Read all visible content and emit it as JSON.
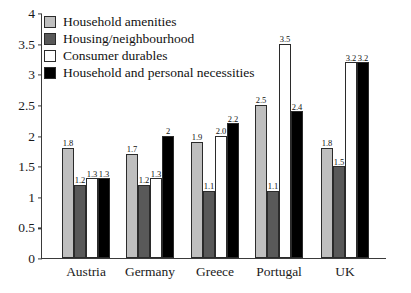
{
  "chart_data": {
    "type": "bar",
    "title": "",
    "xlabel": "",
    "ylabel": "",
    "grid": false,
    "legend_position": "top-left",
    "ylim": [
      0,
      4
    ],
    "ytick_labels": [
      "0",
      "0.5",
      "1",
      "1.5",
      "2",
      "2.5",
      "3",
      "3.5",
      "4"
    ],
    "ytick_values": [
      0,
      0.5,
      1,
      1.5,
      2,
      2.5,
      3,
      3.5,
      4
    ],
    "categories": [
      "Austria",
      "Germany",
      "Greece",
      "Portugal",
      "UK"
    ],
    "series": [
      {
        "name": "Household amenities",
        "color": "#bfbfbf",
        "values": [
          1.8,
          1.7,
          1.9,
          2.5,
          1.8
        ],
        "labels": [
          "1.8",
          "1.7",
          "1.9",
          "2.5",
          "1.8"
        ]
      },
      {
        "name": "Housing/neighbourhood",
        "color": "#595959",
        "values": [
          1.2,
          1.2,
          1.1,
          1.1,
          1.5
        ],
        "labels": [
          "1.2",
          "1.2",
          "1.1",
          "1.1",
          "1.5"
        ]
      },
      {
        "name": "Consumer durables",
        "color": "#ffffff",
        "values": [
          1.3,
          1.3,
          2.0,
          3.5,
          3.2
        ],
        "labels": [
          "1.3",
          "1.3",
          "2.0",
          "3.5",
          "3.2"
        ]
      },
      {
        "name": "Household and personal necessities",
        "color": "#000000",
        "values": [
          1.3,
          2.0,
          2.2,
          2.4,
          3.2
        ],
        "labels": [
          "1.3",
          "2",
          "2.2",
          "2.4",
          "3.2"
        ]
      }
    ]
  }
}
